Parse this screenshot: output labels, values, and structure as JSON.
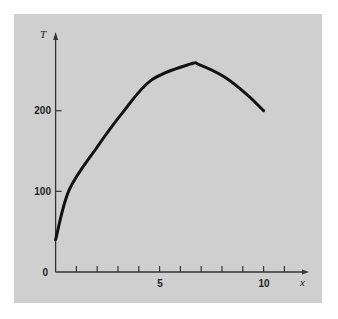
{
  "chart_data": {
    "type": "line",
    "title": "",
    "xlabel": "x",
    "ylabel": "T",
    "xlim": [
      0,
      11.5
    ],
    "ylim": [
      0,
      295
    ],
    "grid": false,
    "legend": null,
    "x_ticks": [
      1,
      2,
      3,
      4,
      5,
      6,
      7,
      8,
      9,
      10,
      11
    ],
    "x_tick_labels": [
      {
        "value": 5,
        "label": "5"
      },
      {
        "value": 10,
        "label": "10"
      }
    ],
    "y_ticks": [
      0,
      100,
      200
    ],
    "y_tick_labels": [
      {
        "value": 0,
        "label": "0"
      },
      {
        "value": 100,
        "label": "100"
      },
      {
        "value": 200,
        "label": "200"
      }
    ],
    "series": [
      {
        "name": "T(x)",
        "x": [
          0,
          0.66,
          2.0,
          3.2,
          4.6,
          6.5,
          6.9,
          8.1,
          9.2,
          10
        ],
        "values": [
          40,
          102,
          155,
          197,
          238,
          258,
          257,
          242,
          220,
          200
        ]
      }
    ]
  },
  "labels": {
    "y_axis": "T",
    "x_axis": "x",
    "y_0": "0",
    "y_100": "100",
    "y_200": "200",
    "x_5": "5",
    "x_10": "10"
  }
}
